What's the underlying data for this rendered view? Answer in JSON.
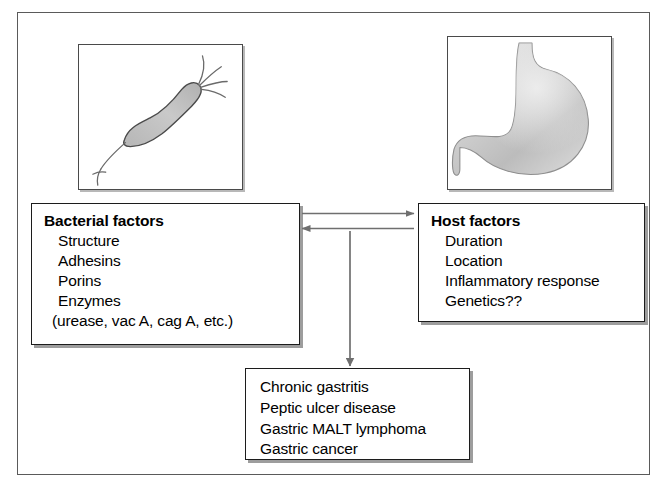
{
  "figure": {
    "kind": "flow-diagram",
    "background_color": "#ffffff",
    "frame_color": "#5a5a5a",
    "box_border_color": "#1c1c1c",
    "shadow_color": "#9d9d9d",
    "illustration_fill": "#c9c9c9"
  },
  "panels": {
    "bacterium": {
      "icon": "helicobacter-bacterium-icon",
      "caption": ""
    },
    "stomach": {
      "icon": "stomach-organ-icon",
      "caption": ""
    }
  },
  "boxes": {
    "bacterial": {
      "title": "Bacterial factors",
      "items": [
        "Structure",
        "Adhesins",
        "Porins",
        "Enzymes",
        "(urease, vac A, cag A, etc.)"
      ]
    },
    "host": {
      "title": "Host factors",
      "items": [
        "Duration",
        "Location",
        "Inflammatory response",
        "Genetics??"
      ]
    },
    "outcomes": {
      "title": "",
      "items": [
        "Chronic gastritis",
        "Peptic ulcer disease",
        "Gastric MALT lymphoma",
        "Gastric cancer"
      ]
    }
  },
  "arrows": [
    {
      "name": "bacterial-to-host-arrow",
      "direction": "right",
      "from": "bacterial",
      "to": "host"
    },
    {
      "name": "host-to-bacterial-arrow",
      "direction": "left",
      "from": "host",
      "to": "bacterial"
    },
    {
      "name": "interaction-to-outcomes-arrow",
      "direction": "down",
      "from": "interaction",
      "to": "outcomes"
    }
  ]
}
